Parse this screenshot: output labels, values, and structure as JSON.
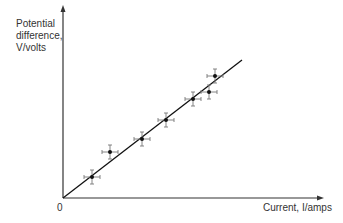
{
  "chart_data": {
    "type": "scatter",
    "title": "",
    "xlabel": "Current, I/amps",
    "ylabel": "Potential difference, V/volts",
    "ylabel_lines": [
      "Potential",
      "difference,",
      "V/volts"
    ],
    "origin_label": "0",
    "axis_ticks": "none",
    "grid": false,
    "legend": "none",
    "error_bars": true,
    "points": [
      {
        "x": 1.0,
        "y": 1.0
      },
      {
        "x": 1.6,
        "y": 2.2
      },
      {
        "x": 2.7,
        "y": 2.9
      },
      {
        "x": 3.5,
        "y": 3.8
      },
      {
        "x": 4.4,
        "y": 4.8
      },
      {
        "x": 5.1,
        "y": 5.1
      },
      {
        "x": 5.3,
        "y": 5.9
      }
    ],
    "best_fit_line": {
      "from": {
        "x": 0,
        "y": 0
      },
      "to": {
        "x": 6.2,
        "y": 6.6
      }
    },
    "pixel_points": [
      [
        92,
        177
      ],
      [
        110,
        152
      ],
      [
        142,
        139
      ],
      [
        166,
        120
      ],
      [
        193,
        99
      ],
      [
        209,
        92
      ],
      [
        215,
        76
      ]
    ],
    "fit_pixels": [
      [
        63,
        198
      ],
      [
        242,
        60
      ]
    ],
    "colors": {
      "axis": "#333333",
      "points": "#111111",
      "error_bars": "#777777",
      "text": "#333333"
    }
  }
}
